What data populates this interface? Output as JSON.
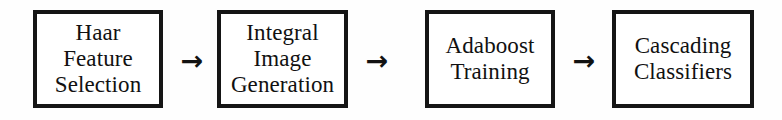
{
  "diagram": {
    "orientation": "horizontal",
    "background_color": "#ffffff",
    "border_color": "#151515",
    "text_color": "#111111",
    "nodes": [
      {
        "id": "haar",
        "lines": [
          "Haar",
          "Feature",
          "Selection"
        ],
        "full_text": "Haar Feature Selection"
      },
      {
        "id": "integral",
        "lines": [
          "Integral",
          "Image",
          "Generation"
        ],
        "full_text": "Integral Image Generation"
      },
      {
        "id": "adaboost",
        "lines": [
          "Adaboost",
          "Training"
        ],
        "full_text": "Adaboost Training"
      },
      {
        "id": "cascading",
        "lines": [
          "Cascading",
          "Classifiers"
        ],
        "full_text": "Cascading Classifiers"
      }
    ],
    "arrows": [
      {
        "id": "arrow-1",
        "glyph": "→",
        "from": "haar",
        "to": "integral"
      },
      {
        "id": "arrow-2",
        "glyph": "→",
        "from": "integral",
        "to": "adaboost"
      },
      {
        "id": "arrow-3",
        "glyph": "→",
        "from": "adaboost",
        "to": "cascading"
      }
    ]
  }
}
